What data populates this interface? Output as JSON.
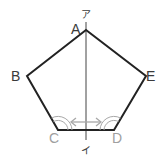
{
  "figure": {
    "shape": "regular-pentagon",
    "vertices": [
      {
        "label": "A",
        "x": 86,
        "y": 30
      },
      {
        "label": "B",
        "x": 27,
        "y": 76
      },
      {
        "label": "C",
        "x": 58,
        "y": 130
      },
      {
        "label": "D",
        "x": 114,
        "y": 130
      },
      {
        "label": "E",
        "x": 146,
        "y": 76
      }
    ],
    "axis_line": {
      "top_label": "ア",
      "bottom_label": "イ"
    },
    "angle_marks": [
      "C",
      "D"
    ],
    "arrow": "double-headed between C and D"
  },
  "labels": {
    "A": "A",
    "B": "B",
    "C": "C",
    "D": "D",
    "E": "E",
    "top": "ア",
    "bottom": "イ"
  },
  "colors": {
    "outline": "#222222",
    "axis": "#444444",
    "marks": "#a8a8a8"
  }
}
